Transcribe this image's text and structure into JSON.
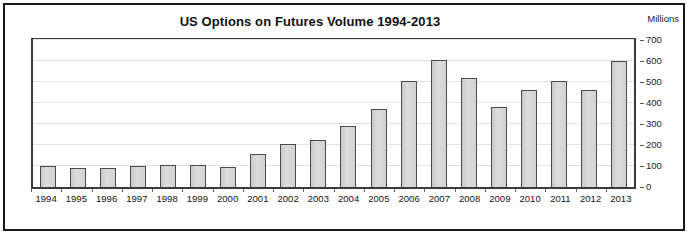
{
  "figure": {
    "title": "US Options on Futures Volume 1994-2013",
    "unit_label": "Millions",
    "frame_color": "#1a1a1a",
    "bar_fill": "#d4d4d4",
    "bar_border": "#4a4a4a",
    "gridline_color": "#e2e2e2"
  },
  "chart_data": {
    "type": "bar",
    "title": "US Options on Futures Volume 1994-2013",
    "subtitle": "",
    "xlabel": "",
    "ylabel": "Millions",
    "ylim": [
      0,
      700
    ],
    "yticks": [
      0,
      100,
      200,
      300,
      400,
      500,
      600,
      700
    ],
    "ytick_labels": [
      "0",
      "100",
      "200",
      "300",
      "400",
      "500",
      "600",
      "700"
    ],
    "y_axis_position": "right",
    "grid": true,
    "grid_axis": "y",
    "legend": false,
    "legend_position": "none",
    "categories": [
      "1994",
      "1995",
      "1996",
      "1997",
      "1998",
      "1999",
      "2000",
      "2001",
      "2002",
      "2003",
      "2004",
      "2005",
      "2006",
      "2007",
      "2008",
      "2009",
      "2010",
      "2011",
      "2012",
      "2013"
    ],
    "values": [
      100,
      90,
      90,
      100,
      105,
      105,
      95,
      155,
      205,
      225,
      290,
      372,
      505,
      605,
      520,
      380,
      460,
      505,
      460,
      600
    ],
    "annotations": []
  }
}
